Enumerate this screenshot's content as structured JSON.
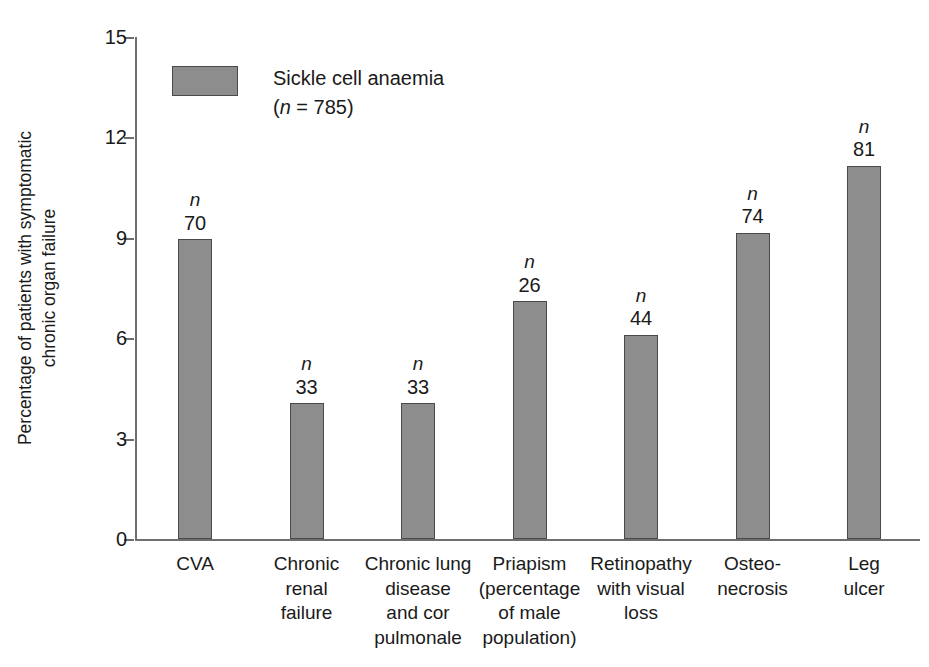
{
  "chart_data": {
    "type": "bar",
    "title": "",
    "xlabel": "",
    "ylabel": "Percentage of patients with symptomatic\nchronic organ failure",
    "ylim": [
      0,
      15
    ],
    "yticks": [
      0,
      3,
      6,
      9,
      12,
      15
    ],
    "grid": false,
    "legend_position": "top-left-inside",
    "categories": [
      "CVA",
      "Chronic\nrenal\nfailure",
      "Chronic lung\ndisease\nand cor\npulmonale",
      "Priapism\n(percentage\nof male\npopulation)",
      "Retinopathy\nwith visual\nloss",
      "Osteo-\nnecrosis",
      "Leg\nulcer"
    ],
    "values": [
      8.95,
      4.05,
      4.05,
      7.1,
      6.1,
      9.15,
      11.15
    ],
    "point_labels": [
      "70",
      "33",
      "33",
      "26",
      "44",
      "74",
      "81"
    ],
    "point_label_prefix": "n",
    "series": [
      {
        "name": "Sickle cell anaemia",
        "n": "785",
        "color": "#8d8d8d",
        "edge_color": "#4a4a4a",
        "values": [
          8.95,
          4.05,
          4.05,
          7.1,
          6.1,
          9.15,
          11.15
        ]
      }
    ]
  },
  "legend": {
    "label": "Sickle cell anaemia",
    "n_line_prefix": "(",
    "n_symbol": "n",
    "n_value": " = 785)"
  },
  "axis": {
    "y_title": "Percentage of patients with symptomatic\nchronic organ failure",
    "y_tick_labels": [
      "0",
      "3",
      "6",
      "9",
      "12",
      "15"
    ],
    "axis_color": "#6e6e6e"
  }
}
